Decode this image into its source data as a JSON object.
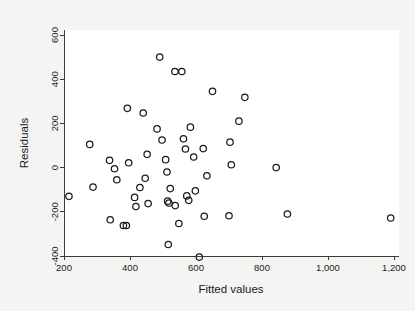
{
  "chart_data": {
    "type": "scatter",
    "title": "",
    "xlabel": "Fitted values",
    "ylabel": "Residuals",
    "xlim": [
      170,
      1240
    ],
    "ylim": [
      -430,
      640
    ],
    "xticks": [
      200,
      400,
      600,
      800,
      1000,
      1200
    ],
    "xtick_labels": [
      "200",
      "400",
      "600",
      "800",
      "1,000",
      "1,200"
    ],
    "yticks": [
      -400,
      -200,
      0,
      200,
      400,
      600
    ],
    "ytick_labels": [
      "-400",
      "-200",
      "0",
      "200",
      "400",
      "600"
    ],
    "grid": false,
    "legend": null,
    "marker": "open-circle",
    "marker_color": "#1a1a1a",
    "panel_color": "#ffffff",
    "background_color": "#f4f4f2",
    "points": [
      {
        "x": 215,
        "y": -130
      },
      {
        "x": 278,
        "y": 105
      },
      {
        "x": 288,
        "y": -88
      },
      {
        "x": 338,
        "y": 33
      },
      {
        "x": 340,
        "y": -236
      },
      {
        "x": 353,
        "y": -5
      },
      {
        "x": 360,
        "y": -55
      },
      {
        "x": 380,
        "y": -262
      },
      {
        "x": 389,
        "y": -262
      },
      {
        "x": 392,
        "y": 268
      },
      {
        "x": 396,
        "y": 22
      },
      {
        "x": 414,
        "y": -135
      },
      {
        "x": 418,
        "y": -176
      },
      {
        "x": 430,
        "y": -90
      },
      {
        "x": 440,
        "y": 247
      },
      {
        "x": 446,
        "y": -48
      },
      {
        "x": 452,
        "y": 60
      },
      {
        "x": 455,
        "y": -163
      },
      {
        "x": 482,
        "y": 175
      },
      {
        "x": 490,
        "y": 500
      },
      {
        "x": 497,
        "y": 125
      },
      {
        "x": 508,
        "y": 36
      },
      {
        "x": 512,
        "y": -20
      },
      {
        "x": 514,
        "y": -152
      },
      {
        "x": 516,
        "y": -348
      },
      {
        "x": 518,
        "y": -160
      },
      {
        "x": 522,
        "y": -95
      },
      {
        "x": 536,
        "y": 435
      },
      {
        "x": 537,
        "y": -172
      },
      {
        "x": 548,
        "y": -253
      },
      {
        "x": 557,
        "y": 435
      },
      {
        "x": 562,
        "y": 130
      },
      {
        "x": 568,
        "y": 84
      },
      {
        "x": 572,
        "y": -128
      },
      {
        "x": 578,
        "y": -148
      },
      {
        "x": 583,
        "y": 183
      },
      {
        "x": 593,
        "y": 48
      },
      {
        "x": 598,
        "y": -105
      },
      {
        "x": 610,
        "y": -405
      },
      {
        "x": 622,
        "y": 86
      },
      {
        "x": 625,
        "y": -220
      },
      {
        "x": 633,
        "y": -37
      },
      {
        "x": 650,
        "y": 345
      },
      {
        "x": 700,
        "y": -218
      },
      {
        "x": 703,
        "y": 115
      },
      {
        "x": 707,
        "y": 13
      },
      {
        "x": 730,
        "y": 210
      },
      {
        "x": 748,
        "y": 318
      },
      {
        "x": 843,
        "y": 0
      },
      {
        "x": 877,
        "y": -210
      },
      {
        "x": 1190,
        "y": -228
      }
    ]
  }
}
